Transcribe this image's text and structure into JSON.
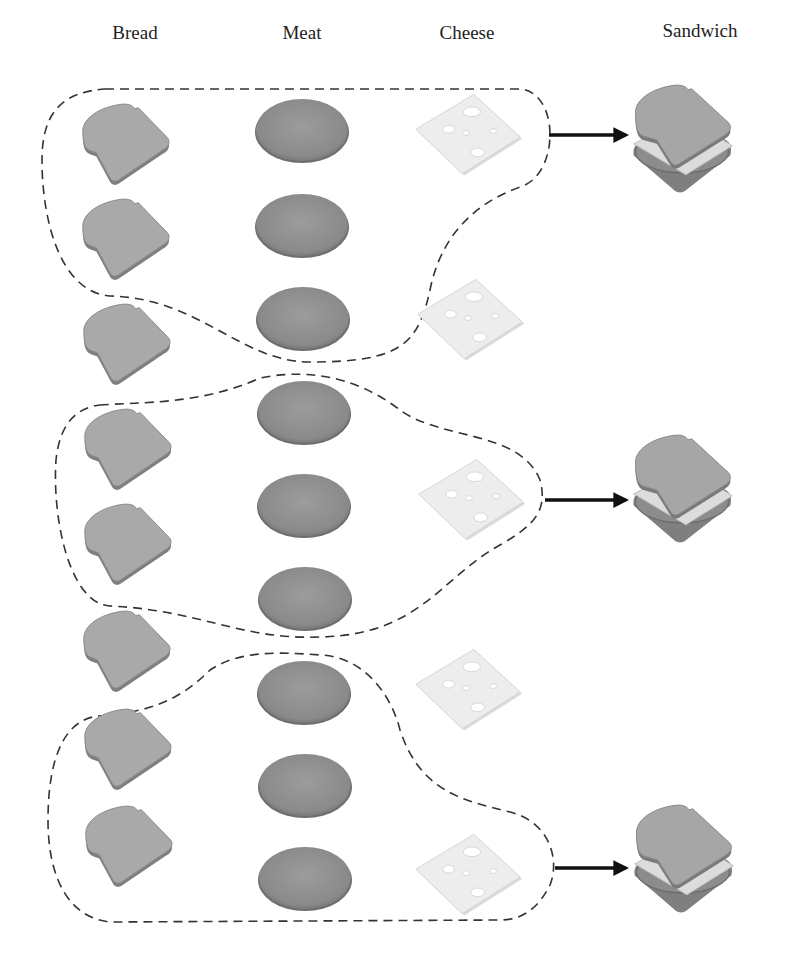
{
  "figure": {
    "columns": [
      {
        "label": "Bread",
        "x": 135,
        "y": 22
      },
      {
        "label": "Meat",
        "x": 302,
        "y": 22
      },
      {
        "label": "Cheese",
        "x": 467,
        "y": 22
      },
      {
        "label": "Sandwich",
        "x": 700,
        "y": 20
      }
    ],
    "colors": {
      "bread_fill": "#a9a9a9",
      "bread_crust": "#7f7f7f",
      "meat_fill": "#8f8f8f",
      "meat_edge": "#6e6e6e",
      "cheese_fill": "#ececec",
      "cheese_edge": "#cfcfcf",
      "dashed_outline": "#333333",
      "arrow": "#111111"
    },
    "bread": [
      {
        "x": 125,
        "y": 145
      },
      {
        "x": 125,
        "y": 240
      },
      {
        "x": 126,
        "y": 345
      },
      {
        "x": 127,
        "y": 450
      },
      {
        "x": 127,
        "y": 545
      },
      {
        "x": 126,
        "y": 652
      },
      {
        "x": 127,
        "y": 750
      },
      {
        "x": 128,
        "y": 847
      }
    ],
    "meat": [
      {
        "x": 302,
        "y": 130
      },
      {
        "x": 302,
        "y": 225
      },
      {
        "x": 303,
        "y": 318
      },
      {
        "x": 304,
        "y": 412
      },
      {
        "x": 304,
        "y": 505
      },
      {
        "x": 305,
        "y": 598
      },
      {
        "x": 304,
        "y": 692
      },
      {
        "x": 305,
        "y": 785
      },
      {
        "x": 305,
        "y": 878
      }
    ],
    "cheese": [
      {
        "x": 468,
        "y": 135
      },
      {
        "x": 470,
        "y": 320
      },
      {
        "x": 471,
        "y": 500
      },
      {
        "x": 468,
        "y": 690
      },
      {
        "x": 468,
        "y": 875
      }
    ],
    "groups": [
      {
        "name": "group-1",
        "arrow": {
          "x1": 549,
          "y1": 135,
          "x2": 626,
          "y2": 135
        },
        "sandwich": {
          "x": 682,
          "y": 140
        }
      },
      {
        "name": "group-2",
        "arrow": {
          "x1": 545,
          "y1": 500,
          "x2": 626,
          "y2": 500
        },
        "sandwich": {
          "x": 682,
          "y": 490
        }
      },
      {
        "name": "group-3",
        "arrow": {
          "x1": 555,
          "y1": 868,
          "x2": 626,
          "y2": 868
        },
        "sandwich": {
          "x": 683,
          "y": 860
        }
      }
    ]
  }
}
